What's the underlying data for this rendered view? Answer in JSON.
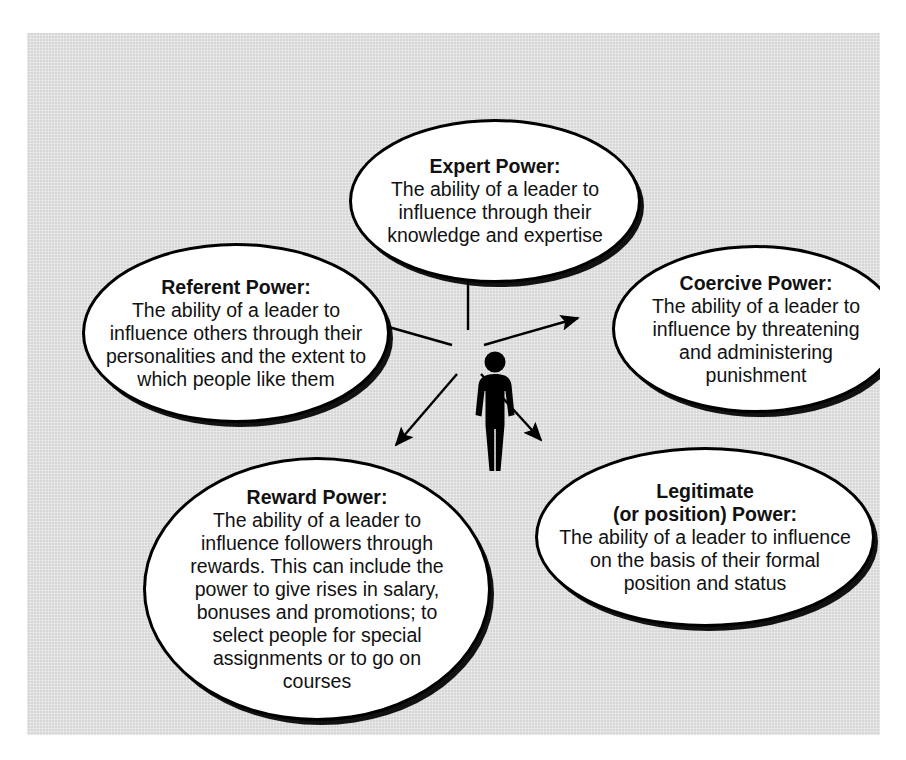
{
  "diagram": {
    "type": "hub-and-spoke",
    "center": {
      "icon": "person-silhouette-icon",
      "label": "Leader"
    },
    "background_color": "#dcdcdc",
    "node_fill": "#ffffff",
    "node_stroke": "#000000",
    "nodes": [
      {
        "id": "expert",
        "title": "Expert Power:",
        "body": "The ability of a leader to influence through their knowledge and expertise",
        "position": "top"
      },
      {
        "id": "referent",
        "title": "Referent Power:",
        "body": "The ability of a leader to influence others through their personalities and the extent to which people like them",
        "position": "left"
      },
      {
        "id": "coercive",
        "title": "Coercive Power:",
        "body": "The ability of a leader to influence by threatening and administering punishment",
        "position": "right"
      },
      {
        "id": "reward",
        "title": "Reward Power:",
        "body": "The ability of a leader to influence followers through rewards. This can include the power to give rises in salary, bonuses and promotions; to select people for special assignments or to go on courses",
        "position": "bottom-left"
      },
      {
        "id": "legitimate",
        "title": "Legitimate (or position) Power:",
        "title_line1": "Legitimate",
        "title_line2": "(or position) Power:",
        "body": "The ability of a leader to influence on the basis of their formal position and status",
        "position": "bottom-right"
      }
    ],
    "arrows": [
      {
        "from": "center",
        "to": "expert",
        "direction": "up"
      },
      {
        "from": "center",
        "to": "referent",
        "direction": "up-left"
      },
      {
        "from": "center",
        "to": "coercive",
        "direction": "up-right"
      },
      {
        "from": "center",
        "to": "reward",
        "direction": "down-left"
      },
      {
        "from": "center",
        "to": "legitimate",
        "direction": "down-right"
      }
    ]
  }
}
